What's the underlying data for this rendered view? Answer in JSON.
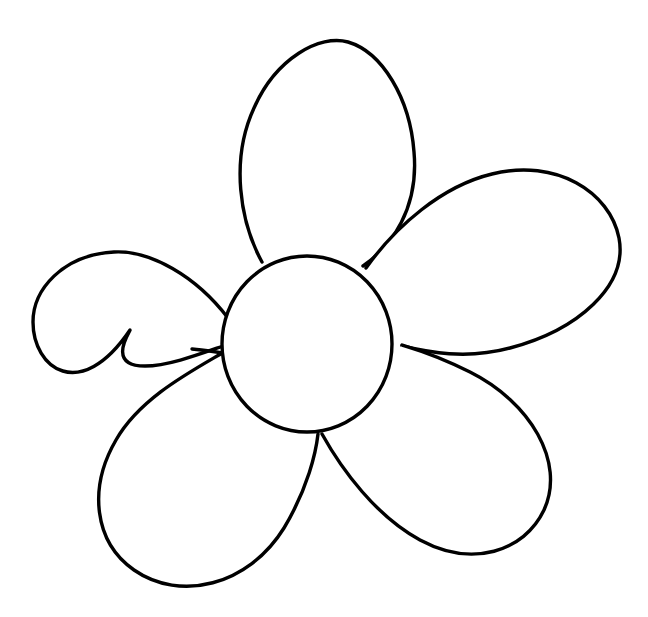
{
  "artwork": {
    "title": "Five-Petal Flower Outline",
    "subject": "flower",
    "style": "line-art coloring page outline",
    "caption": "Black outline drawing of a simple five-petal flower with a round center on a white background.",
    "background_color": "#ffffff",
    "stroke_color": "#000000",
    "fill_color": "#ffffff",
    "stroke_width_px": 3.4,
    "canvas": {
      "width_px": 648,
      "height_px": 617
    },
    "center": {
      "name": "flower-center",
      "label": "Flower center disc",
      "cx": 307,
      "cy": 344,
      "rx": 85,
      "ry": 88
    },
    "petals": [
      {
        "name": "petal-top",
        "label": "Top petal",
        "position": "top",
        "order": 1,
        "path": "M 262 262 C 240 222 230 160 254 108 C 276 58 320 34 348 42 C 382 52 410 98 414 152 C 419 208 392 246 363 266"
      },
      {
        "name": "petal-left",
        "label": "Upper left petal",
        "position": "upper-left",
        "order": 2,
        "path": "M 228 318 C 196 276 150 250 114 252 C 62 255 33 290 33 322 C 33 368 80 404 130 330 C 131 330 105 366 145 366 C 168 366 200 354 223 346"
      },
      {
        "name": "petal-right",
        "label": "Upper right petal",
        "position": "upper-right",
        "order": 3,
        "path": "M 366 268 C 396 226 442 186 492 174 C 556 158 610 192 619 238 C 628 286 578 330 510 348 C 466 360 428 352 402 346"
      },
      {
        "name": "petal-bottom-left",
        "label": "Lower left petal",
        "position": "lower-left",
        "order": 4,
        "path": "M 224 352 C 190 372 140 398 116 440 C 88 488 94 542 134 570 C 180 602 248 586 284 528 C 308 488 316 452 318 434"
      },
      {
        "name": "petal-bottom-right",
        "label": "Lower right petal",
        "position": "lower-right",
        "order": 5,
        "path": "M 322 434 C 342 470 376 516 420 540 C 472 568 524 552 544 510 C 566 462 530 402 470 372 C 430 352 404 346 402 345"
      }
    ],
    "connector_lines": [
      {
        "name": "connector-left-stem",
        "label": "Left petal inner seam",
        "path": "M 222 353 C 212 351 202 350 192 349"
      }
    ]
  }
}
